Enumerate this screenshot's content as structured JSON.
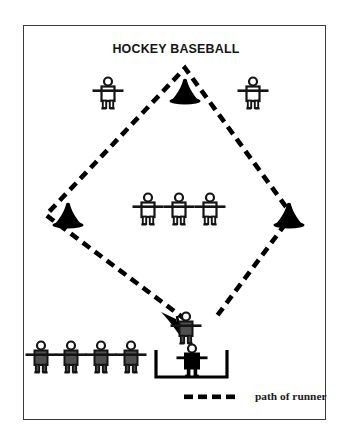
{
  "figure": {
    "title": "HOCKEY BASEBALL",
    "border_color": "#3a3a3a",
    "background": "#ffffff"
  },
  "legend": {
    "dash_swatch_name": "dashed-line-swatch",
    "label": "path of runner",
    "dash_color": "#000000",
    "dash_count": 4
  },
  "colors": {
    "fielder_outline": "#141414",
    "fielder_fill": "#ffffff",
    "runner_fill": "#4f4f4f",
    "batter_fill": "#000000",
    "cone_fill": "#000000",
    "path_color": "#000000"
  },
  "field": {
    "diamond": {
      "top": [
        185,
        68
      ],
      "left": [
        46,
        215
      ],
      "right": [
        292,
        215
      ],
      "bottom": [
        186,
        322
      ],
      "dash_pattern": "9 6",
      "stroke_width": 4.6
    },
    "arrow": {
      "name": "runner-path-arrowhead",
      "tip": [
        176,
        330
      ],
      "direction": "down-right"
    },
    "batting_box": {
      "name": "batting-box-bracket",
      "left": 155,
      "right": 228,
      "top": 352,
      "bottom": 378,
      "stroke_width": 3.2
    }
  },
  "cones": [
    {
      "name": "cone-second-base",
      "x": 185,
      "y": 92,
      "label": "second base"
    },
    {
      "name": "cone-third-base",
      "x": 68,
      "y": 216,
      "label": "third base"
    },
    {
      "name": "cone-first-base",
      "x": 289,
      "y": 216,
      "label": "first base"
    }
  ],
  "fielders": [
    {
      "name": "fielder-left-outfield",
      "x": 108,
      "y": 97
    },
    {
      "name": "fielder-right-outfield",
      "x": 253,
      "y": 97
    },
    {
      "name": "fielder-infield-left",
      "x": 148,
      "y": 213
    },
    {
      "name": "fielder-infield-center",
      "x": 179,
      "y": 213
    },
    {
      "name": "fielder-infield-right",
      "x": 210,
      "y": 213
    }
  ],
  "runners_waiting": [
    {
      "name": "runner-waiting-1",
      "x": 41,
      "y": 361
    },
    {
      "name": "runner-waiting-2",
      "x": 71,
      "y": 361
    },
    {
      "name": "runner-waiting-3",
      "x": 101,
      "y": 361
    },
    {
      "name": "runner-waiting-4",
      "x": 131,
      "y": 361
    }
  ],
  "active_runner": {
    "name": "runner-active",
    "x": 186,
    "y": 332
  },
  "batter": {
    "name": "batter",
    "x": 192,
    "y": 364
  }
}
